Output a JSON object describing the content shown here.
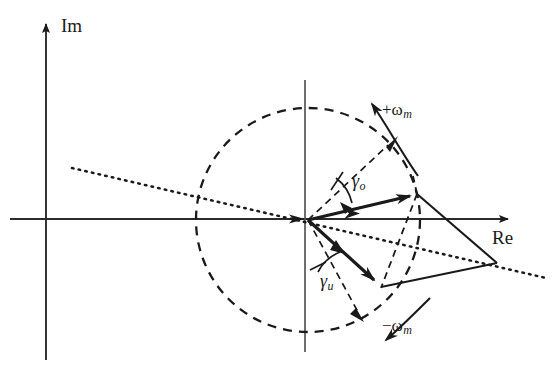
{
  "figure": {
    "type": "phasor-diagram",
    "width": 552,
    "height": 367,
    "background_color": "#ffffff",
    "stroke_color": "#1a1a1a"
  },
  "axes": {
    "imaginary": {
      "label": "Im",
      "label_x": 62,
      "label_y": 18,
      "x": 46,
      "y_top": 20,
      "y_bottom": 360,
      "arrow": "up"
    },
    "real": {
      "label": "Re",
      "label_x": 492,
      "label_y": 228,
      "y": 219,
      "x_left": 10,
      "x_right": 515,
      "arrow": "right"
    }
  },
  "origin": {
    "x": 308,
    "y": 220
  },
  "circle": {
    "center_x": 308,
    "center_y": 220,
    "radius": 112,
    "style": "dashed",
    "dash": "9 7",
    "stroke_width": 2.2
  },
  "vertical_reference": {
    "x": 305,
    "y_top": 80,
    "y_bottom": 352,
    "style": "solid",
    "stroke_width": 1.6
  },
  "vectors": [
    {
      "name": "upper-phasor",
      "angle_label": "γ",
      "angle_subscript": "o",
      "from_x": 308,
      "from_y": 220,
      "to_x": 417,
      "to_y": 194,
      "style": "solid",
      "stroke_width": 3
    },
    {
      "name": "lower-phasor",
      "angle_label": "γ",
      "angle_subscript": "u",
      "from_x": 308,
      "from_y": 220,
      "to_x": 381,
      "to_y": 286,
      "style": "solid",
      "stroke_width": 3
    }
  ],
  "angle_labels": [
    {
      "name": "gamma-o",
      "symbol": "γ",
      "subscript": "o",
      "x": 352,
      "y": 172
    },
    {
      "name": "gamma-u",
      "symbol": "γ",
      "subscript": "u",
      "x": 322,
      "y": 272
    }
  ],
  "rotation_labels": [
    {
      "name": "positive-omega",
      "sign": "+",
      "symbol": "ω",
      "subscript": "m",
      "x": 384,
      "y": 102,
      "direction": "counterclockwise"
    },
    {
      "name": "negative-omega",
      "sign": "−",
      "symbol": "ω",
      "subscript": "m",
      "x": 384,
      "y": 318,
      "direction": "clockwise"
    }
  ],
  "right_vertex": {
    "x": 497,
    "y": 263
  },
  "dotted_line": {
    "x1": 72,
    "y1": 168,
    "x2": 540,
    "y2": 276,
    "style": "dotted",
    "stroke_width": 2.4,
    "dash": "1.5 5"
  },
  "dashed_reference_lines": [
    {
      "name": "upper-angle-ray",
      "x1": 308,
      "y1": 220,
      "x2": 384,
      "y2": 148
    },
    {
      "name": "lower-angle-ray",
      "x1": 308,
      "y1": 220,
      "x2": 360,
      "y2": 308
    },
    {
      "name": "vertical-chord",
      "x1": 417,
      "y1": 194,
      "x2": 381,
      "y2": 286
    }
  ],
  "solid_connectors": [
    {
      "name": "upper-to-vertex",
      "x1": 417,
      "y1": 194,
      "x2": 497,
      "y2": 263
    },
    {
      "name": "lower-to-vertex",
      "x1": 381,
      "y1": 286,
      "x2": 497,
      "y2": 263
    }
  ]
}
